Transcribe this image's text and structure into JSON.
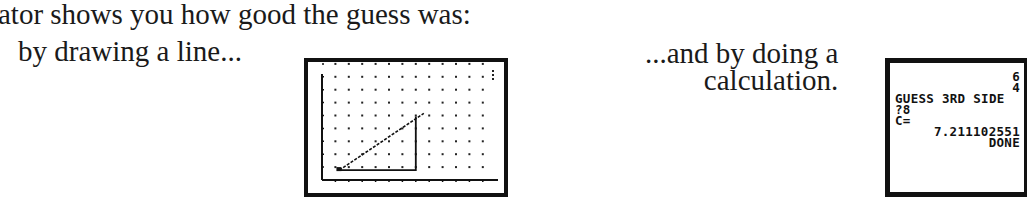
{
  "text": {
    "intro": "ator shows you how good the guess was:",
    "caption_line": "by drawing a line...",
    "caption_calc_1": "...and by doing a",
    "caption_calc_2": "calculation."
  },
  "graph_screen": {
    "description": "calculator graph screen with dot grid, axes, and a right triangle whose hypotenuse is drawn as a guess line",
    "grid_rows": 9,
    "grid_cols": 12,
    "triangle": {
      "base_from": [
        1,
        0
      ],
      "base_to": [
        7,
        0
      ],
      "height": 4
    },
    "guess_line_end": [
      7.6,
      4.4
    ]
  },
  "calc_screen": {
    "lines": [
      {
        "text": "6",
        "align": "right"
      },
      {
        "text": "4",
        "align": "right"
      },
      {
        "text": "GUESS 3RD SIDE",
        "align": "left"
      },
      {
        "text": "?8",
        "align": "left"
      },
      {
        "text": "C=",
        "align": "left"
      },
      {
        "text": "7.211102551",
        "align": "right"
      },
      {
        "text": "DONE",
        "align": "right"
      }
    ]
  }
}
